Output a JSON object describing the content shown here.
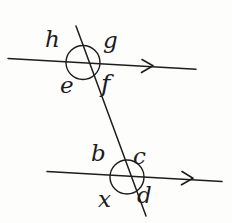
{
  "figure": {
    "kind": "geometry-diagram",
    "ink_color": "#1d1d1d",
    "background_color": "#fdfdfc",
    "labels": {
      "top_upper_left": "h",
      "top_upper_right": "g",
      "top_lower_left": "e",
      "top_lower_right": "f",
      "bottom_upper_left": "b",
      "bottom_upper_right": "c",
      "bottom_lower_left": "x",
      "bottom_lower_right": "d"
    },
    "geometry": {
      "top_parallel_line": {
        "x1": 8,
        "y1": 58,
        "x2": 196,
        "y2": 69
      },
      "bottom_parallel_line": {
        "x1": 47,
        "y1": 172,
        "x2": 222,
        "y2": 182
      },
      "transversal_line": {
        "x1": 76,
        "y1": 26,
        "x2": 146,
        "y2": 216
      },
      "top_intersection_circle": {
        "cx": 83,
        "cy": 62,
        "r": 17
      },
      "bottom_intersection_circle": {
        "cx": 127,
        "cy": 177,
        "r": 17
      },
      "top_arrowhead": {
        "x": 152,
        "y": 66
      },
      "bottom_arrowhead": {
        "x": 192,
        "y": 178
      }
    }
  }
}
